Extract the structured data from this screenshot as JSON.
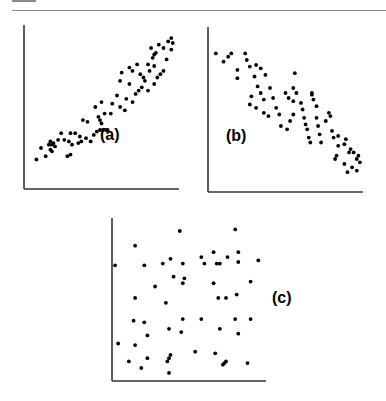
{
  "chart_data": [
    {
      "type": "scatter",
      "title": "",
      "label": "(a)",
      "xlabel": "",
      "ylabel": "",
      "xlim": [
        0,
        100
      ],
      "ylim": [
        0,
        100
      ],
      "grid": false,
      "description": "strong positive correlation",
      "axis": {
        "x0": 24,
        "y0": 189,
        "x1": 179,
        "y1": 25
      },
      "label_pos": {
        "x": 100,
        "y": 140
      },
      "points": [
        [
          8,
          18
        ],
        [
          14,
          20
        ],
        [
          11,
          25
        ],
        [
          16,
          27
        ],
        [
          17,
          29
        ],
        [
          18,
          27
        ],
        [
          19,
          28
        ],
        [
          17,
          24
        ],
        [
          18,
          23
        ],
        [
          20,
          26
        ],
        [
          22,
          30
        ],
        [
          26,
          30
        ],
        [
          29,
          29
        ],
        [
          31,
          27
        ],
        [
          30,
          21
        ],
        [
          28,
          20
        ],
        [
          24,
          34
        ],
        [
          30,
          34
        ],
        [
          33,
          34
        ],
        [
          36,
          32
        ],
        [
          37,
          29
        ],
        [
          35,
          28
        ],
        [
          40,
          31
        ],
        [
          43,
          29
        ],
        [
          45,
          33
        ],
        [
          47,
          35
        ],
        [
          49,
          36
        ],
        [
          51,
          36
        ],
        [
          53,
          36
        ],
        [
          54,
          36
        ],
        [
          38,
          42
        ],
        [
          41,
          41
        ],
        [
          46,
          50
        ],
        [
          48,
          44
        ],
        [
          49,
          42
        ],
        [
          50,
          40
        ],
        [
          52,
          46
        ],
        [
          57,
          52
        ],
        [
          56,
          46
        ],
        [
          62,
          50
        ],
        [
          50,
          53
        ],
        [
          60,
          57
        ],
        [
          65,
          48
        ],
        [
          66,
          55
        ],
        [
          70,
          53
        ],
        [
          72,
          58
        ],
        [
          74,
          60
        ],
        [
          76,
          62
        ],
        [
          78,
          66
        ],
        [
          77,
          68
        ],
        [
          75,
          70
        ],
        [
          70,
          72
        ],
        [
          68,
          64
        ],
        [
          62,
          66
        ],
        [
          63,
          71
        ],
        [
          68,
          74
        ],
        [
          73,
          76
        ],
        [
          80,
          76
        ],
        [
          81,
          72
        ],
        [
          83,
          80
        ],
        [
          84,
          75
        ],
        [
          86,
          68
        ],
        [
          84,
          64
        ],
        [
          80,
          60
        ],
        [
          82,
          86
        ],
        [
          84,
          82
        ],
        [
          85,
          83
        ],
        [
          87,
          88
        ],
        [
          90,
          86
        ],
        [
          93,
          90
        ],
        [
          95,
          85
        ],
        [
          96,
          89
        ],
        [
          95,
          92
        ],
        [
          92,
          79
        ],
        [
          90,
          72
        ],
        [
          88,
          70
        ]
      ]
    },
    {
      "type": "scatter",
      "title": "",
      "label": "(b)",
      "xlabel": "",
      "ylabel": "",
      "xlim": [
        0,
        100
      ],
      "ylim": [
        0,
        100
      ],
      "grid": false,
      "description": "strong negative correlation",
      "axis": {
        "x0": 208,
        "y0": 192,
        "x1": 363,
        "y1": 27
      },
      "label_pos": {
        "x": 226,
        "y": 141
      },
      "points": [
        [
          5,
          84
        ],
        [
          10,
          79
        ],
        [
          13,
          82
        ],
        [
          15,
          84
        ],
        [
          19,
          74
        ],
        [
          19,
          69
        ],
        [
          24,
          84
        ],
        [
          25,
          80
        ],
        [
          27,
          76
        ],
        [
          31,
          77
        ],
        [
          34,
          75
        ],
        [
          30,
          70
        ],
        [
          37,
          71
        ],
        [
          32,
          64
        ],
        [
          34,
          60
        ],
        [
          36,
          56
        ],
        [
          40,
          63
        ],
        [
          42,
          57
        ],
        [
          44,
          51
        ],
        [
          46,
          47
        ],
        [
          28,
          58
        ],
        [
          27,
          53
        ],
        [
          31,
          51
        ],
        [
          36,
          48
        ],
        [
          39,
          46
        ],
        [
          50,
          60
        ],
        [
          52,
          57
        ],
        [
          55,
          63
        ],
        [
          56,
          72
        ],
        [
          57,
          60
        ],
        [
          55,
          55
        ],
        [
          55,
          47
        ],
        [
          53,
          43
        ],
        [
          51,
          38
        ],
        [
          47,
          40
        ],
        [
          60,
          54
        ],
        [
          61,
          50
        ],
        [
          62,
          45
        ],
        [
          63,
          41
        ],
        [
          64,
          38
        ],
        [
          65,
          33
        ],
        [
          66,
          30
        ],
        [
          67,
          60
        ],
        [
          67,
          59
        ],
        [
          68,
          56
        ],
        [
          70,
          52
        ],
        [
          70,
          45
        ],
        [
          71,
          40
        ],
        [
          72,
          35
        ],
        [
          73,
          30
        ],
        [
          76,
          43
        ],
        [
          78,
          48
        ],
        [
          79,
          46
        ],
        [
          80,
          37
        ],
        [
          81,
          33
        ],
        [
          84,
          28
        ],
        [
          83,
          22
        ],
        [
          82,
          20
        ],
        [
          84,
          34
        ],
        [
          88,
          29
        ],
        [
          89,
          32
        ],
        [
          91,
          24
        ],
        [
          92,
          26
        ],
        [
          94,
          24
        ],
        [
          96,
          20
        ],
        [
          97,
          22
        ],
        [
          98,
          18
        ],
        [
          96,
          13
        ],
        [
          93,
          15
        ],
        [
          90,
          12
        ],
        [
          88,
          17
        ]
      ]
    },
    {
      "type": "scatter",
      "title": "",
      "label": "(c)",
      "xlabel": "",
      "ylabel": "",
      "xlim": [
        0,
        100
      ],
      "ylim": [
        0,
        100
      ],
      "grid": false,
      "description": "no correlation",
      "axis": {
        "x0": 112,
        "y0": 381,
        "x1": 266,
        "y1": 218
      },
      "label_pos": {
        "x": 272,
        "y": 303
      },
      "points": [
        [
          44,
          92
        ],
        [
          80,
          93
        ],
        [
          15,
          83
        ],
        [
          66,
          79
        ],
        [
          82,
          79
        ],
        [
          38,
          75
        ],
        [
          58,
          76
        ],
        [
          75,
          76
        ],
        [
          95,
          74
        ],
        [
          2,
          71
        ],
        [
          21,
          71
        ],
        [
          33,
          72
        ],
        [
          46,
          72
        ],
        [
          60,
          72
        ],
        [
          68,
          72
        ],
        [
          70,
          72
        ],
        [
          82,
          73
        ],
        [
          40,
          64
        ],
        [
          47,
          63
        ],
        [
          46,
          60
        ],
        [
          28,
          58
        ],
        [
          66,
          60
        ],
        [
          90,
          61
        ],
        [
          15,
          51
        ],
        [
          35,
          48
        ],
        [
          69,
          51
        ],
        [
          74,
          51
        ],
        [
          81,
          53
        ],
        [
          14,
          37
        ],
        [
          21,
          36
        ],
        [
          46,
          38
        ],
        [
          58,
          38
        ],
        [
          80,
          38
        ],
        [
          90,
          38
        ],
        [
          37,
          32
        ],
        [
          45,
          30
        ],
        [
          70,
          32
        ],
        [
          82,
          29
        ],
        [
          23,
          28
        ],
        [
          4,
          23
        ],
        [
          15,
          22
        ],
        [
          54,
          18
        ],
        [
          67,
          17
        ],
        [
          11,
          12
        ],
        [
          23,
          14
        ],
        [
          36,
          12
        ],
        [
          37,
          14
        ],
        [
          38,
          16
        ],
        [
          72,
          10
        ],
        [
          73,
          11
        ],
        [
          74,
          12
        ],
        [
          88,
          11
        ],
        [
          19,
          8
        ],
        [
          37,
          5
        ]
      ]
    }
  ]
}
